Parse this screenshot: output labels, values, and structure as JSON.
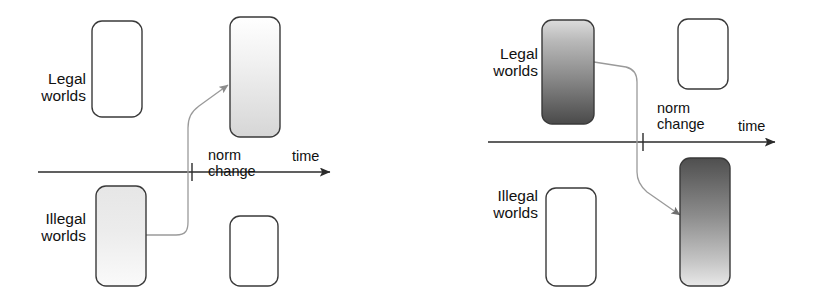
{
  "figure": {
    "panel_count": 2,
    "background_color": "#ffffff",
    "stroke_color": "#2b2b2b"
  },
  "panels": [
    {
      "id": "left",
      "name": "illegal-to-legal-panel",
      "labels": {
        "legal": "Legal\nworlds",
        "legal_line1": "Legal",
        "legal_line2": "worlds",
        "illegal": "Illegal\nworlds",
        "illegal_line1": "Illegal",
        "illegal_line2": "worlds",
        "norm": "norm",
        "change": "change",
        "time": "time"
      },
      "boxes": [
        {
          "name": "legal-box-before",
          "fill": "none",
          "row": "legal",
          "side": "before"
        },
        {
          "name": "legal-box-after",
          "fill": "gradient-light-down",
          "row": "legal",
          "side": "after"
        },
        {
          "name": "illegal-box-before",
          "fill": "gradient-light-up",
          "row": "illegal",
          "side": "before"
        },
        {
          "name": "illegal-box-after",
          "fill": "none",
          "row": "illegal",
          "side": "after"
        }
      ],
      "arrow": {
        "name": "transition-arrow",
        "from": "illegal-box-before",
        "to": "legal-box-after",
        "direction": "up-right"
      }
    },
    {
      "id": "right",
      "name": "legal-to-illegal-panel",
      "labels": {
        "legal": "Legal\nworlds",
        "legal_line1": "Legal",
        "legal_line2": "worlds",
        "illegal": "Illegal\nworlds",
        "illegal_line1": "Illegal",
        "illegal_line2": "worlds",
        "norm": "norm",
        "change": "change",
        "time": "time"
      },
      "boxes": [
        {
          "name": "legal-box-before",
          "fill": "gradient-dark-down",
          "row": "legal",
          "side": "before"
        },
        {
          "name": "legal-box-after",
          "fill": "none",
          "row": "legal",
          "side": "after"
        },
        {
          "name": "illegal-box-before",
          "fill": "none",
          "row": "illegal",
          "side": "before"
        },
        {
          "name": "illegal-box-after",
          "fill": "gradient-dark-up",
          "row": "illegal",
          "side": "after"
        }
      ],
      "arrow": {
        "name": "transition-arrow",
        "from": "legal-box-before",
        "to": "illegal-box-after",
        "direction": "down-right"
      }
    }
  ],
  "colors": {
    "stroke": "#2b2b2b",
    "connector": "#9a9a9a",
    "light_gradient_top": "#ffffff",
    "light_gradient_bottom": "#d8d8d8",
    "dark_gradient_top": "#c9c9c9",
    "dark_gradient_bottom": "#4d4d4d",
    "text": "#111111"
  }
}
